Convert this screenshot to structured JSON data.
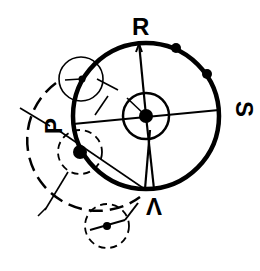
{
  "diagram": {
    "type": "mechanism-schematic",
    "colors": {
      "stroke": "#000000",
      "background": "#ffffff"
    },
    "labels": {
      "r": "R",
      "s": "S",
      "p": "P",
      "v": "V"
    },
    "main_circle": {
      "cx": 146,
      "cy": 116,
      "r": 73,
      "style": "thick-solid"
    },
    "hub_circle": {
      "cx": 146,
      "cy": 116,
      "r": 23,
      "style": "solid"
    },
    "small_circles": [
      {
        "name": "upper-left-solid",
        "cx": 81,
        "cy": 79,
        "r": 22,
        "style": "thin-solid"
      },
      {
        "name": "left-dashed",
        "cx": 80,
        "cy": 152,
        "r": 22,
        "style": "dashed"
      },
      {
        "name": "bottom-dashed",
        "cx": 107,
        "cy": 226,
        "r": 22,
        "style": "dashed"
      }
    ],
    "large_dashed_arc": {
      "cx": 80,
      "cy": 152,
      "r": 70,
      "style": "dashed"
    },
    "rim_dots": 2
  }
}
